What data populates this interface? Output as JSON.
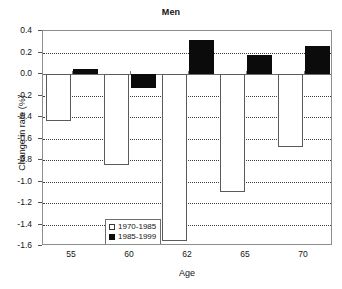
{
  "chart_data": {
    "type": "bar",
    "title": "Men",
    "xlabel": "Age",
    "ylabel": "Change in rate (%)",
    "categories": [
      "55",
      "60",
      "62",
      "65",
      "70"
    ],
    "series": [
      {
        "name": "1970-1985",
        "style": "open",
        "values": [
          -0.44,
          -0.85,
          -1.55,
          -1.1,
          -0.68
        ]
      },
      {
        "name": "1985-1999",
        "style": "solid",
        "values": [
          0.05,
          -0.13,
          0.32,
          0.18,
          0.26
        ]
      }
    ],
    "ylim": [
      -1.6,
      0.4
    ],
    "ytick_step": 0.2,
    "yticks": [
      "0.4",
      "0.2",
      "0.0",
      "-0.2",
      "-0.4",
      "-0.6",
      "-0.8",
      "-1.0",
      "-1.2",
      "-1.4",
      "-1.6"
    ],
    "ytick_values": [
      0.4,
      0.2,
      0.0,
      -0.2,
      -0.4,
      -0.6,
      -0.8,
      -1.0,
      -1.2,
      -1.4,
      -1.6
    ],
    "grid": true,
    "legend_position": "inside-lower-left",
    "colors": {
      "open_fill": "#ffffff",
      "open_edge": "#5a5a5a",
      "solid_fill": "#0b0b0b",
      "axis": "#8d8d8d",
      "grid": "#3d3d3d",
      "text": "#141414"
    }
  }
}
